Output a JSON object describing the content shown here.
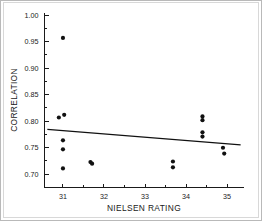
{
  "chart_data": {
    "type": "scatter",
    "title": "",
    "xlabel": "NIELSEN RATING",
    "ylabel": "CORRELATION",
    "xlim": [
      30.55,
      35.4
    ],
    "ylim": [
      0.675,
      1.005
    ],
    "xticks": [
      31,
      32,
      33,
      34,
      35
    ],
    "xtick_labels": [
      "31",
      "32",
      "33",
      "34",
      "35"
    ],
    "yticks": [
      0.7,
      0.75,
      0.8,
      0.85,
      0.9,
      0.95,
      1.0
    ],
    "ytick_labels": [
      "0.70",
      "0.75",
      "0.80",
      "0.85",
      "0.90",
      "0.95",
      "1.00"
    ],
    "x_minor_ticks": [
      31.5,
      32.5,
      33.5,
      34.5
    ],
    "y_minor_ticks": [
      0.725,
      0.775,
      0.825,
      0.875,
      0.925,
      0.975
    ],
    "grid": false,
    "legend": null,
    "marker": "filled-circle",
    "marker_color": "#111111",
    "x": [
      31.0,
      30.9,
      31.03,
      31.0,
      31.0,
      31.0,
      31.67,
      31.71,
      33.68,
      33.68,
      34.4,
      34.4,
      34.4,
      34.4,
      34.9,
      34.93
    ],
    "y": [
      0.957,
      0.807,
      0.812,
      0.764,
      0.747,
      0.711,
      0.723,
      0.72,
      0.724,
      0.713,
      0.809,
      0.802,
      0.779,
      0.771,
      0.75,
      0.739
    ],
    "points": [
      {
        "x": 31.0,
        "y": 0.957
      },
      {
        "x": 30.9,
        "y": 0.807
      },
      {
        "x": 31.03,
        "y": 0.812
      },
      {
        "x": 31.0,
        "y": 0.764
      },
      {
        "x": 31.0,
        "y": 0.747
      },
      {
        "x": 31.0,
        "y": 0.711
      },
      {
        "x": 31.67,
        "y": 0.723
      },
      {
        "x": 31.71,
        "y": 0.72
      },
      {
        "x": 33.68,
        "y": 0.724
      },
      {
        "x": 33.68,
        "y": 0.713
      },
      {
        "x": 34.4,
        "y": 0.809
      },
      {
        "x": 34.4,
        "y": 0.802
      },
      {
        "x": 34.4,
        "y": 0.779
      },
      {
        "x": 34.4,
        "y": 0.771
      },
      {
        "x": 34.9,
        "y": 0.75
      },
      {
        "x": 34.93,
        "y": 0.739
      }
    ],
    "trendline": {
      "type": "linear-fit",
      "x0": 30.62,
      "y0": 0.7845,
      "x1": 35.33,
      "y1": 0.7555,
      "color": "#111111"
    }
  },
  "figure": {
    "background": "#ffffff",
    "frame_color": "#b9b9b9",
    "axis_color": "#1a1a1a"
  }
}
